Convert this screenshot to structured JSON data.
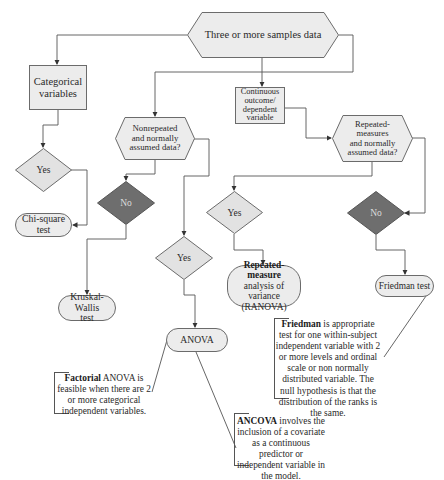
{
  "diagram": {
    "colors": {
      "light_fill": "#ececec",
      "dark_fill": "#6e6e6e",
      "stroke": "#6b6b6b",
      "line": "#555555"
    },
    "root": {
      "label": "Three or more samples data"
    },
    "categorical": {
      "box": "Categorical variables",
      "yes": "Yes",
      "result": "Chi-square test"
    },
    "nonrepeated": {
      "question": "Nonrepeated and normally assumed data?",
      "no": "No",
      "no_result_line1": "Kruskal-Wallis",
      "no_result_line2": "test",
      "yes": "Yes",
      "yes_result": "ANOVA"
    },
    "continuous": {
      "box_line1": "Continuous",
      "box_line2": "outcome/",
      "box_line3": "dependent",
      "box_line4": "variable"
    },
    "repeated": {
      "question_line1": "Repeated-",
      "question_line2": "measures",
      "question_line3": "and normally",
      "question_line4": "assumed data?",
      "yes": "Yes",
      "yes_result_bold": "Repeated-measure",
      "yes_result_line2": "analysis of variance",
      "yes_result_line3": "(RANOVA)",
      "no": "No",
      "no_result": "Friedman test"
    },
    "notes": {
      "factorial_bold": "Factorial",
      "factorial_text": " ANOVA is feasible when there are 2 or more categorical independent variables.",
      "friedman_bold": "Friedman",
      "friedman_text": " is appropriate test for one within-subject independent variable with 2 or more levels and ordinal scale or non normally distributed variable. The null hypothesis is that the distribution of the ranks is the same.",
      "ancova_bold": "ANCOVA",
      "ancova_text": " involves the inclusion of a covariate as a continuous predictor or independent variable in the model."
    }
  }
}
